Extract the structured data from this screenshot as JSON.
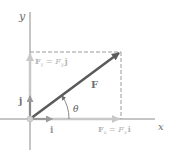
{
  "diagram": {
    "axes": {
      "x_label": "x",
      "y_label": "y"
    },
    "vectors": {
      "F": {
        "label": "F",
        "color": "#5a5a5a"
      },
      "Fx": {
        "label_lhs": "F",
        "label_lhs_sub": "x",
        "label_eq": " = ",
        "label_rhs": "F",
        "label_rhs_sub": "x",
        "label_unit": "i",
        "color": "#c8c8c8"
      },
      "Fy": {
        "label_lhs": "F",
        "label_lhs_sub": "y",
        "label_eq": " = ",
        "label_rhs": "F",
        "label_rhs_sub": "y",
        "label_unit": "j",
        "color": "#c8c8c8"
      },
      "i": {
        "label": "i",
        "color": "#9a9a9a"
      },
      "j": {
        "label": "j",
        "color": "#8a8a8a"
      }
    },
    "angle": {
      "label": "θ"
    },
    "colors": {
      "axis": "#8c8c8c",
      "dashed": "#9a9a9a",
      "text": "#6e6e6e",
      "text_light": "#b4b4b4"
    }
  }
}
